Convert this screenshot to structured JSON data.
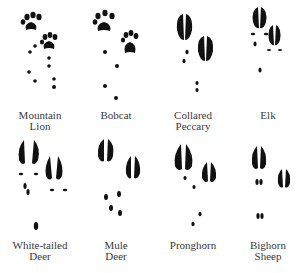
{
  "ink_color": "#111111",
  "label_color": "#3a3a3a",
  "rows": [
    {
      "animals": [
        {
          "id": "mountain-lion",
          "label_lines": [
            "Mountain",
            "Lion"
          ],
          "track_type": "paw"
        },
        {
          "id": "bobcat",
          "label_lines": [
            "Bobcat"
          ],
          "track_type": "paw"
        },
        {
          "id": "collared-peccary",
          "label_lines": [
            "Collared",
            "Peccary"
          ],
          "track_type": "hoof"
        },
        {
          "id": "elk",
          "label_lines": [
            "Elk"
          ],
          "track_type": "hoof"
        }
      ]
    },
    {
      "animals": [
        {
          "id": "white-tailed-deer",
          "label_lines": [
            "White-tailed",
            "Deer"
          ],
          "track_type": "hoof"
        },
        {
          "id": "mule-deer",
          "label_lines": [
            "Mule",
            "Deer"
          ],
          "track_type": "hoof"
        },
        {
          "id": "pronghorn",
          "label_lines": [
            "Pronghorn"
          ],
          "track_type": "hoof"
        },
        {
          "id": "bighorn-sheep",
          "label_lines": [
            "Bighorn",
            "Sheep"
          ],
          "track_type": "hoof"
        }
      ]
    }
  ]
}
